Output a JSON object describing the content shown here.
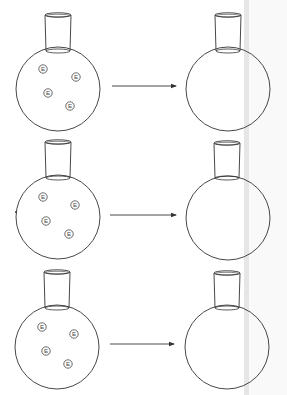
{
  "diagram": {
    "colors": {
      "stroke": "#333333",
      "particle_stroke": "#444444",
      "scan_bar": "#e6e6e6",
      "background": "#ffffff"
    },
    "particle_label": "E",
    "rows": [
      {
        "left_flask": {
          "cx": 58,
          "cy": 89,
          "r": 42,
          "neck_x1": 45,
          "neck_x2": 71,
          "neck_top": 15,
          "neck_bottom": 51
        },
        "particles": [
          {
            "x": 43,
            "y": 69,
            "label": "E"
          },
          {
            "x": 76,
            "y": 77,
            "label": "E"
          },
          {
            "x": 48,
            "y": 93,
            "label": "E"
          },
          {
            "x": 70,
            "y": 106,
            "label": "E"
          }
        ],
        "arrow": {
          "x1": 112,
          "x2": 176,
          "y": 86
        },
        "right_flask": {
          "cx": 228,
          "cy": 89,
          "r": 42,
          "neck_x1": 215,
          "neck_x2": 241,
          "neck_top": 15,
          "neck_bottom": 51
        }
      },
      {
        "left_flask": {
          "cx": 58,
          "cy": 217,
          "r": 42,
          "neck_x1": 45,
          "neck_x2": 71,
          "neck_top": 142,
          "neck_bottom": 178
        },
        "particles": [
          {
            "x": 43,
            "y": 197,
            "label": "E"
          },
          {
            "x": 75,
            "y": 205,
            "label": "E"
          },
          {
            "x": 46,
            "y": 221,
            "label": "E"
          },
          {
            "x": 69,
            "y": 234,
            "label": "E"
          }
        ],
        "arrow": {
          "x1": 110,
          "x2": 176,
          "y": 215
        },
        "right_flask": {
          "cx": 228,
          "cy": 218,
          "r": 42,
          "neck_x1": 214,
          "neck_x2": 240,
          "neck_top": 143,
          "neck_bottom": 178
        }
      },
      {
        "left_flask": {
          "cx": 57,
          "cy": 347,
          "r": 42,
          "neck_x1": 44,
          "neck_x2": 70,
          "neck_top": 272,
          "neck_bottom": 308
        },
        "particles": [
          {
            "x": 42,
            "y": 327,
            "label": "E"
          },
          {
            "x": 74,
            "y": 334,
            "label": "E"
          },
          {
            "x": 46,
            "y": 351,
            "label": "E"
          },
          {
            "x": 68,
            "y": 364,
            "label": "E"
          }
        ],
        "arrow": {
          "x1": 110,
          "x2": 174,
          "y": 344
        },
        "right_flask": {
          "cx": 227,
          "cy": 347,
          "r": 42,
          "neck_x1": 214,
          "neck_x2": 240,
          "neck_top": 273,
          "neck_bottom": 308
        }
      }
    ]
  }
}
